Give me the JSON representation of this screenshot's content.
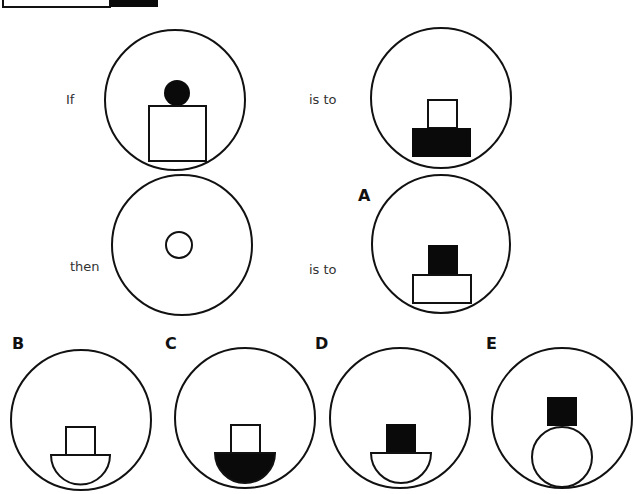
{
  "puzzle": {
    "labels": {
      "if": "If",
      "is_to_1": "is to",
      "then": "then",
      "is_to_2": "is to"
    },
    "options": [
      {
        "letter": "A",
        "description": "Black small square on top of a wide white rectangle at bottom of circle"
      },
      {
        "letter": "B",
        "description": "White small square on top of a white semicircle bowl at bottom of circle"
      },
      {
        "letter": "C",
        "description": "White small square on top of a black semicircle bowl at bottom of circle"
      },
      {
        "letter": "D",
        "description": "Black small square on top of a white semicircle bowl at bottom of circle"
      },
      {
        "letter": "E",
        "description": "Black small square on top of a white circle resting at bottom of circle"
      }
    ],
    "colors": {
      "stroke": "#111111",
      "fill_black": "#0a0a0a",
      "fill_white": "#ffffff"
    }
  }
}
